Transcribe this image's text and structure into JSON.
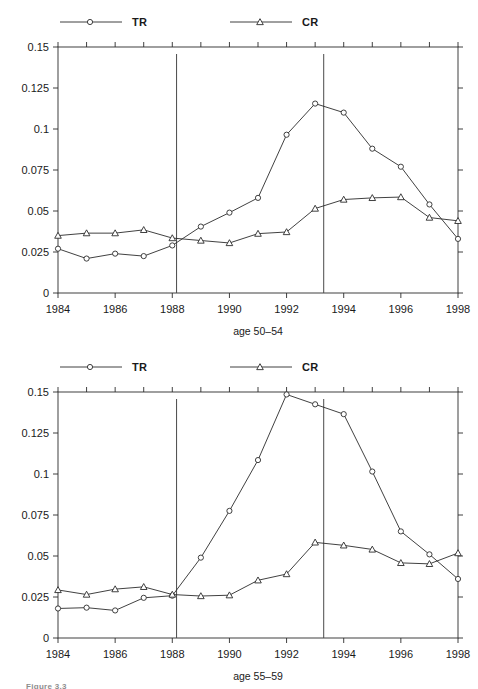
{
  "figure": {
    "caption": "Figure 3.3",
    "background": "#ffffff",
    "line_color": "#2b2b2b",
    "axis_color": "#2b2b2b",
    "vline_color": "#4a4a4a"
  },
  "chart_data": [
    {
      "id": "age-50-54",
      "type": "line",
      "title": "",
      "xlabel": "age 50–54",
      "ylabel": "",
      "xlim": [
        1984,
        1998
      ],
      "ylim": [
        0,
        0.15
      ],
      "grid": false,
      "legend_position": "top",
      "x": [
        1984,
        1985,
        1986,
        1987,
        1988,
        1989,
        1990,
        1991,
        1992,
        1993,
        1994,
        1995,
        1996,
        1997,
        1998
      ],
      "xtick_labels": [
        "1984",
        "1986",
        "1988",
        "1990",
        "1992",
        "1994",
        "1996",
        "1998"
      ],
      "xtick_values": [
        1984,
        1986,
        1988,
        1990,
        1992,
        1994,
        1996,
        1998
      ],
      "ytick_labels": [
        "0",
        "0.025",
        "0.05",
        "0.075",
        "0.1",
        "0.125",
        "0.15"
      ],
      "ytick_values": [
        0,
        0.025,
        0.05,
        0.075,
        0.1,
        0.125,
        0.15
      ],
      "vlines": [
        1988.15,
        1993.3
      ],
      "series": [
        {
          "name": "TR",
          "marker": "circle",
          "values": [
            0.027,
            0.021,
            0.024,
            0.0225,
            0.029,
            0.0405,
            0.049,
            0.058,
            0.0965,
            0.1155,
            0.11,
            0.088,
            0.077,
            0.054,
            0.033
          ]
        },
        {
          "name": "CR",
          "marker": "triangle",
          "values": [
            0.035,
            0.0365,
            0.0365,
            0.0385,
            0.0335,
            0.032,
            0.0305,
            0.0362,
            0.0372,
            0.0515,
            0.057,
            0.058,
            0.0585,
            0.046,
            0.044
          ]
        }
      ]
    },
    {
      "id": "age-55-59",
      "type": "line",
      "title": "",
      "xlabel": "age 55–59",
      "ylabel": "",
      "xlim": [
        1984,
        1998
      ],
      "ylim": [
        0,
        0.15
      ],
      "grid": false,
      "legend_position": "top",
      "x": [
        1984,
        1985,
        1986,
        1987,
        1988,
        1989,
        1990,
        1991,
        1992,
        1993,
        1994,
        1995,
        1996,
        1997,
        1998
      ],
      "xtick_labels": [
        "1984",
        "1986",
        "1988",
        "1990",
        "1992",
        "1994",
        "1996",
        "1998"
      ],
      "xtick_values": [
        1984,
        1986,
        1988,
        1990,
        1992,
        1994,
        1996,
        1998
      ],
      "ytick_labels": [
        "0",
        "0.025",
        "0.05",
        "0.075",
        "0.1",
        "0.125",
        "0.15"
      ],
      "ytick_values": [
        0,
        0.025,
        0.05,
        0.075,
        0.1,
        0.125,
        0.15
      ],
      "vlines": [
        1988.15,
        1993.3
      ],
      "series": [
        {
          "name": "TR",
          "marker": "circle",
          "values": [
            0.018,
            0.0185,
            0.0168,
            0.0245,
            0.0258,
            0.049,
            0.0775,
            0.1085,
            0.1485,
            0.1425,
            0.1365,
            0.1015,
            0.065,
            0.051,
            0.036
          ]
        },
        {
          "name": "CR",
          "marker": "triangle",
          "values": [
            0.0293,
            0.0265,
            0.0298,
            0.0312,
            0.0265,
            0.0256,
            0.0261,
            0.0352,
            0.039,
            0.0583,
            0.0565,
            0.054,
            0.0458,
            0.0452,
            0.0518
          ]
        }
      ]
    }
  ]
}
